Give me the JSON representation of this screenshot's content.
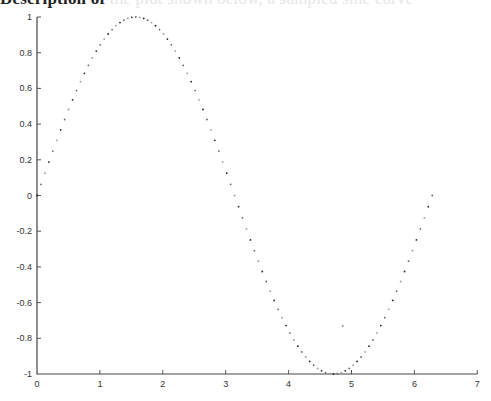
{
  "caption": {
    "visible": "Description of",
    "faded": " the plot shown below, a sampled sine curve"
  },
  "chart_data": {
    "type": "scatter",
    "title": "",
    "xlabel": "",
    "ylabel": "",
    "xlim": [
      0,
      7
    ],
    "ylim": [
      -1,
      1
    ],
    "grid": false,
    "legend": null,
    "xticks": [
      0,
      1,
      2,
      3,
      4,
      5,
      6,
      7
    ],
    "xtick_labels": [
      "0",
      "1",
      "2",
      "3",
      "4",
      "5",
      "6",
      "7"
    ],
    "yticks": [
      1,
      0.8,
      0.6,
      0.4,
      0.2,
      0,
      -0.2,
      -0.4,
      -0.6,
      -0.8,
      -1
    ],
    "ytick_labels": [
      "1",
      "0.8",
      "0.6",
      "0.4",
      "0.2",
      "0",
      "-0.2",
      "-0.4",
      "-0.6",
      "-0.8",
      "-1"
    ],
    "series": [
      {
        "name": "sin(x)",
        "function": "sin",
        "x_start": 0,
        "x_end": 6.2832,
        "n_points": 101,
        "marker": "dot",
        "color": "#333333"
      }
    ],
    "annotations": [
      {
        "type": "stray-dot",
        "x": 4.86,
        "y": -0.73
      }
    ]
  },
  "layout": {
    "x0_px": 37,
    "x_scale": 62.9,
    "y_top_px": 17,
    "y_bottom_px": 374
  }
}
